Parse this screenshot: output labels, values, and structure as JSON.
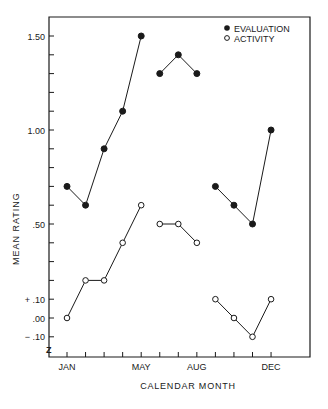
{
  "chart_data": {
    "type": "line",
    "title": "",
    "xlabel": "CALENDAR MONTH",
    "ylabel": "MEAN RATING",
    "x": [
      "JAN",
      "FEB",
      "MAR",
      "APR",
      "MAY",
      "JUN",
      "JUL",
      "AUG",
      "SEP",
      "OCT",
      "NOV",
      "DEC"
    ],
    "x_tick_labels": [
      {
        "index": 0,
        "label": "JAN"
      },
      {
        "index": 4,
        "label": "MAY"
      },
      {
        "index": 7,
        "label": "AUG"
      },
      {
        "index": 11,
        "label": "DEC"
      }
    ],
    "y_tick_labels": [
      {
        "value": 1.5,
        "label": "1.50"
      },
      {
        "value": 1.0,
        "label": "1.00"
      },
      {
        "value": 0.5,
        "label": ".50"
      },
      {
        "value": 0.1,
        "label": "+ .10"
      },
      {
        "value": 0.0,
        "label": ".00"
      },
      {
        "value": -0.1,
        "label": "− .10"
      }
    ],
    "y_minor_tick_step": 0.1,
    "ylim": [
      -0.2,
      1.6
    ],
    "grid": false,
    "legend_position": "upper right",
    "segments_note": "Lines connect points within Jan-May, Jun-Aug, Sep-Dec segments",
    "segments": [
      [
        0,
        4
      ],
      [
        5,
        7
      ],
      [
        8,
        11
      ]
    ],
    "series": [
      {
        "name": "EVALUATION",
        "marker": "filled-circle",
        "values": [
          0.7,
          0.6,
          0.9,
          1.1,
          1.5,
          1.3,
          1.4,
          1.3,
          0.7,
          0.6,
          0.5,
          1.0
        ]
      },
      {
        "name": "ACTIVITY",
        "marker": "open-circle",
        "values": [
          0.0,
          0.2,
          0.2,
          0.4,
          0.6,
          0.5,
          0.5,
          0.4,
          0.1,
          0.0,
          -0.1,
          0.1
        ]
      }
    ]
  },
  "legend": {
    "items": [
      {
        "label": "EVALUATION",
        "marker": "filled-circle"
      },
      {
        "label": "ACTIVITY",
        "marker": "open-circle"
      }
    ]
  },
  "axes": {
    "xlabel": "CALENDAR MONTH",
    "ylabel": "MEAN RATING",
    "scale_break_symbol": "Z"
  },
  "colors": {
    "ink": "#1a1a1a",
    "background": "#ffffff"
  }
}
